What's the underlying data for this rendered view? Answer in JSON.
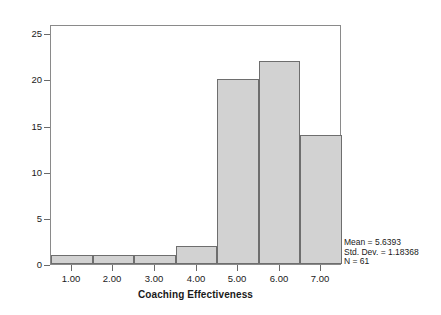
{
  "chart_data": {
    "type": "bar",
    "title": "",
    "subtitle": "",
    "xlabel": "Coaching Effectiveness",
    "ylabel": "Frequency",
    "categories": [
      "1.00",
      "2.00",
      "3.00",
      "4.00",
      "5.00",
      "6.00",
      "7.00"
    ],
    "values": [
      1,
      1,
      1,
      2,
      20,
      22,
      14
    ],
    "bin_edges": [
      0.5,
      1.5,
      2.5,
      3.5,
      4.5,
      5.5,
      6.5,
      7.5
    ],
    "bin_centers": [
      1,
      2,
      3,
      4,
      5,
      6,
      7
    ],
    "xlim": [
      0.5,
      7.5
    ],
    "ylim": [
      0,
      26
    ],
    "x_ticks": [
      "1.00",
      "2.00",
      "3.00",
      "4.00",
      "5.00",
      "6.00",
      "7.00"
    ],
    "x_tick_values": [
      1,
      2,
      3,
      4,
      5,
      6,
      7
    ],
    "y_ticks": [
      "0",
      "5",
      "10",
      "15",
      "20",
      "25"
    ],
    "y_tick_values": [
      0,
      5,
      10,
      15,
      20,
      25
    ],
    "grid": false,
    "legend": false,
    "bar_fill_color": "#d2d2d2",
    "bar_edge_color": "#6e6e6e",
    "frame_color": "#8a8a8a",
    "background_color": "#ffffff"
  },
  "annotation": {
    "mean_label": "Mean = 5.6393",
    "std_dev_label": "Std. Dev. = 1.18368",
    "n_label": "N = 61",
    "position": "bottom-right"
  }
}
